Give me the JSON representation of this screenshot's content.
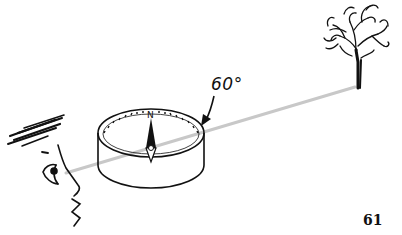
{
  "illustration": {
    "description": "Hand-drawn sketch of a person sighting a tree across a compass",
    "angle_label": "60°",
    "compass_north_label": "N",
    "page_number": "61",
    "colors": {
      "ink": "#111111",
      "sight_line": "#c8c8c8",
      "background": "#ffffff"
    }
  }
}
